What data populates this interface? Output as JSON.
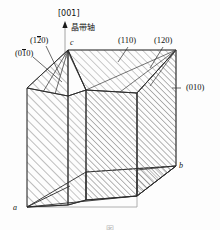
{
  "figure": {
    "type": "crystallographic-habit-diagram",
    "zone_axis": {
      "index": "[001]",
      "annotation": "晶带轴",
      "arrow": "up-arrow-icon"
    },
    "axes": [
      {
        "name": "a",
        "label": "a"
      },
      {
        "name": "b",
        "label": "b"
      },
      {
        "name": "c",
        "label": "c"
      }
    ],
    "face_labels": [
      {
        "id": "face-1bar20",
        "prefix": "(1",
        "barred": "2",
        "suffix": "0)"
      },
      {
        "id": "face-01bar0",
        "prefix": "(0",
        "barred": "1",
        "suffix": "0)"
      },
      {
        "id": "face-110",
        "text": "(110)"
      },
      {
        "id": "face-120",
        "text": "(120)"
      },
      {
        "id": "face-010",
        "text": "(010)"
      }
    ],
    "caption": "图",
    "colors": {
      "ink": "#1a1a1a",
      "hatch": "#555555",
      "light_edge": "#8d8d8d",
      "paper": "#fdfdfd"
    }
  }
}
